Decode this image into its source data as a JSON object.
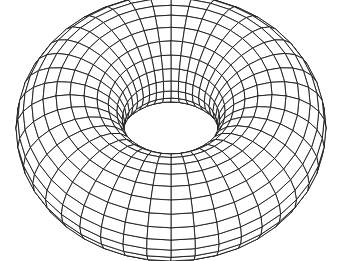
{
  "figure": {
    "background": "#ffffff",
    "line_color": "#1a1a1a",
    "fill_color": "#ffffff",
    "torus": {
      "center_x": 171,
      "center_y": 128,
      "major_radius": 101,
      "minor_radius": 54,
      "elevation_deg": 52,
      "major_segments": 40,
      "minor_segments": 24,
      "stroke_width": 0.9
    }
  }
}
